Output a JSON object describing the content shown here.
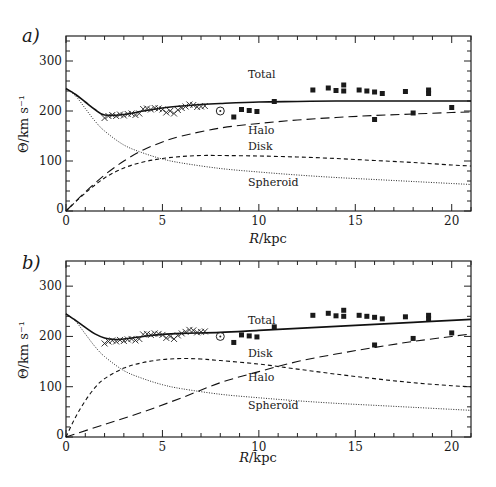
{
  "figure": {
    "panels": [
      "a)",
      "b)"
    ]
  },
  "chart_data": [
    {
      "panel": "a)",
      "type": "line",
      "title": "",
      "xlabel": "R/kpc",
      "ylabel": "Θ/km s⁻¹",
      "xlim": [
        0,
        21
      ],
      "ylim": [
        0,
        350
      ],
      "xticks": [
        0,
        5,
        10,
        15,
        20
      ],
      "yticks": [
        0,
        100,
        200,
        300
      ],
      "grid": false,
      "series": [
        {
          "name": "Total",
          "style": "solid",
          "x": [
            0,
            0.5,
            1,
            1.5,
            2,
            3,
            4,
            5,
            6,
            7,
            8,
            10,
            12,
            14,
            16,
            18,
            20,
            21
          ],
          "y": [
            245,
            233,
            218,
            203,
            192,
            193,
            200,
            206,
            210,
            213,
            215,
            218,
            219,
            220,
            220,
            220,
            220,
            220
          ]
        },
        {
          "name": "Halo",
          "style": "long-dash",
          "x": [
            0,
            1,
            2,
            3,
            4,
            5,
            6,
            8,
            10,
            12,
            14,
            16,
            18,
            20,
            21
          ],
          "y": [
            0,
            38,
            72,
            100,
            122,
            138,
            150,
            166,
            175,
            182,
            187,
            191,
            194,
            197,
            198
          ]
        },
        {
          "name": "Disk",
          "style": "short-dash",
          "x": [
            0,
            1,
            2,
            3,
            4,
            5,
            6,
            7,
            8,
            10,
            12,
            14,
            16,
            18,
            20,
            21
          ],
          "y": [
            0,
            36,
            66,
            86,
            98,
            105,
            109,
            111,
            111,
            110,
            108,
            105,
            101,
            97,
            92,
            90
          ]
        },
        {
          "name": "Spheroid",
          "style": "dotted",
          "x": [
            0,
            0.5,
            1,
            1.5,
            2,
            3,
            4,
            5,
            6,
            8,
            10,
            12,
            14,
            16,
            18,
            20,
            21
          ],
          "y": [
            245,
            230,
            205,
            180,
            160,
            132,
            116,
            104,
            96,
            85,
            78,
            72,
            67,
            63,
            59,
            55,
            53
          ]
        }
      ],
      "observations": {
        "crosses": {
          "x": [
            2.0,
            2.2,
            2.4,
            2.6,
            2.8,
            3.0,
            3.2,
            3.4,
            3.6,
            3.8,
            4.0,
            4.2,
            4.4,
            4.6,
            4.8,
            5.0,
            5.2,
            5.4,
            5.6,
            5.8,
            6.0,
            6.2,
            6.4,
            6.6,
            6.8,
            7.0,
            7.2
          ],
          "y": [
            186,
            190,
            192,
            190,
            193,
            191,
            194,
            195,
            192,
            195,
            204,
            205,
            203,
            206,
            205,
            203,
            197,
            200,
            195,
            202,
            206,
            209,
            213,
            212,
            208,
            209,
            210
          ]
        },
        "sun": {
          "x": 8.0,
          "y": 200
        },
        "squares": {
          "x": [
            8.7,
            9.1,
            9.5,
            9.9,
            10.8,
            12.8,
            13.6,
            14.0,
            14.4,
            14.4,
            15.2,
            15.6,
            16.0,
            16.0,
            16.4,
            17.6,
            18.0,
            18.8,
            18.8,
            20.0
          ],
          "y": [
            188,
            203,
            201,
            199,
            219,
            242,
            246,
            241,
            252,
            240,
            242,
            240,
            238,
            183,
            235,
            239,
            196,
            242,
            235,
            207
          ]
        }
      },
      "annotations": [
        "Total",
        "Halo",
        "Disk",
        "Spheroid"
      ]
    },
    {
      "panel": "b)",
      "type": "line",
      "title": "",
      "xlabel": "R/kpc",
      "ylabel": "Θ/km s⁻¹",
      "xlim": [
        0,
        21
      ],
      "ylim": [
        0,
        350
      ],
      "xticks": [
        0,
        5,
        10,
        15,
        20
      ],
      "yticks": [
        0,
        100,
        200,
        300
      ],
      "grid": false,
      "series": [
        {
          "name": "Total",
          "style": "solid",
          "x": [
            0,
            0.5,
            1,
            1.5,
            2,
            2.5,
            3,
            4,
            5,
            6,
            8,
            10,
            12,
            14,
            16,
            18,
            20,
            21
          ],
          "y": [
            245,
            232,
            218,
            205,
            197,
            194,
            195,
            200,
            204,
            206,
            208,
            212,
            216,
            220,
            224,
            228,
            232,
            234
          ]
        },
        {
          "name": "Disk",
          "style": "short-dash",
          "x": [
            0,
            0.5,
            1,
            1.5,
            2,
            3,
            4,
            5,
            6,
            7,
            8,
            10,
            12,
            14,
            16,
            18,
            20,
            21
          ],
          "y": [
            0,
            40,
            72,
            98,
            116,
            137,
            148,
            154,
            156,
            155,
            152,
            145,
            135,
            125,
            116,
            108,
            102,
            100
          ]
        },
        {
          "name": "Halo",
          "style": "long-dash",
          "x": [
            0,
            2,
            4,
            6,
            8,
            10,
            12,
            14,
            16,
            18,
            20,
            21
          ],
          "y": [
            0,
            25,
            50,
            78,
            108,
            130,
            150,
            165,
            178,
            190,
            200,
            205
          ]
        },
        {
          "name": "Spheroid",
          "style": "dotted",
          "x": [
            0,
            0.5,
            1,
            1.5,
            2,
            3,
            4,
            5,
            6,
            8,
            10,
            12,
            14,
            16,
            18,
            20,
            21
          ],
          "y": [
            245,
            230,
            205,
            180,
            160,
            132,
            116,
            104,
            96,
            85,
            78,
            72,
            67,
            63,
            59,
            55,
            53
          ]
        }
      ],
      "observations": {
        "crosses": {
          "x": [
            2.0,
            2.2,
            2.4,
            2.6,
            2.8,
            3.0,
            3.2,
            3.4,
            3.6,
            3.8,
            4.0,
            4.2,
            4.4,
            4.6,
            4.8,
            5.0,
            5.2,
            5.4,
            5.6,
            5.8,
            6.0,
            6.2,
            6.4,
            6.6,
            6.8,
            7.0,
            7.2
          ],
          "y": [
            186,
            190,
            192,
            190,
            193,
            191,
            194,
            195,
            192,
            195,
            204,
            205,
            203,
            206,
            205,
            203,
            197,
            200,
            195,
            202,
            206,
            209,
            213,
            212,
            208,
            209,
            210
          ]
        },
        "sun": {
          "x": 8.0,
          "y": 200
        },
        "squares": {
          "x": [
            8.7,
            9.1,
            9.5,
            9.9,
            10.8,
            12.8,
            13.6,
            14.0,
            14.4,
            14.4,
            15.2,
            15.6,
            16.0,
            16.0,
            16.4,
            17.6,
            18.0,
            18.8,
            18.8,
            20.0
          ],
          "y": [
            188,
            203,
            201,
            199,
            219,
            242,
            246,
            241,
            252,
            240,
            242,
            240,
            238,
            183,
            235,
            239,
            196,
            242,
            235,
            207
          ]
        }
      },
      "annotations": [
        "Total",
        "Disk",
        "Halo",
        "Spheroid"
      ]
    }
  ],
  "labels": {
    "panel_a": {
      "tag": "a)",
      "ylabel": "Θ/km s⁻¹",
      "xlabel_italic": "R",
      "xlabel_rest": "/kpc",
      "curve_labels": {
        "total": "Total",
        "halo": "Halo",
        "disk": "Disk",
        "spheroid": "Spheroid"
      }
    },
    "panel_b": {
      "tag": "b)",
      "ylabel": "Θ/km s⁻¹",
      "xlabel_italic": "R",
      "xlabel_rest": "/kpc",
      "curve_labels": {
        "total": "Total",
        "disk": "Disk",
        "halo": "Halo",
        "spheroid": "Spheroid"
      }
    }
  }
}
